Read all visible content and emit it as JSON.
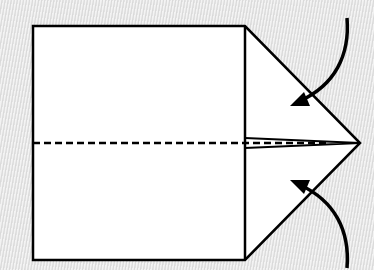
{
  "diagram": {
    "type": "origami-fold-step",
    "colors": {
      "background": "#e4e4e4",
      "paper": "#ffffff",
      "line": "#000000"
    },
    "paper_shape": {
      "left": 33,
      "top": 26,
      "right_edge_x": 245,
      "bottom": 260,
      "tip": {
        "x": 360,
        "y": 143
      }
    },
    "center_crease": {
      "style": "valley-fold-dashed",
      "y": 143,
      "x_start": 33,
      "x_end": 360
    },
    "arrows": [
      {
        "name": "top-fold-arrow",
        "direction": "down-left",
        "from": {
          "x": 347,
          "y": 18
        },
        "to": {
          "x": 292,
          "y": 104
        }
      },
      {
        "name": "bottom-fold-arrow",
        "direction": "up-left",
        "from": {
          "x": 347,
          "y": 268
        },
        "to": {
          "x": 292,
          "y": 182
        }
      }
    ]
  }
}
